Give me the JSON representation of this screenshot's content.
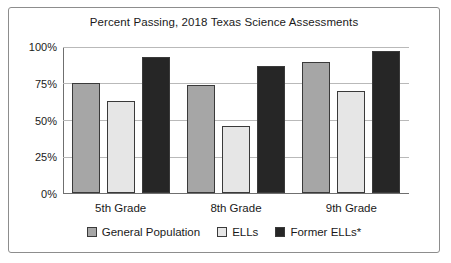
{
  "chart_data": {
    "type": "bar",
    "title": "Percent Passing, 2018 Texas Science Assessments",
    "xlabel": "",
    "ylabel": "",
    "categories": [
      "5th Grade",
      "8th Grade",
      "9th Grade"
    ],
    "series": [
      {
        "name": "General Population",
        "color": "#a6a6a6",
        "values": [
          75,
          74,
          90
        ]
      },
      {
        "name": "ELLs",
        "color": "#e6e6e6",
        "values": [
          63,
          46,
          70
        ]
      },
      {
        "name": "Former ELLs*",
        "color": "#262626",
        "values": [
          93,
          87,
          97
        ]
      }
    ],
    "ylim": [
      0,
      100
    ],
    "yticks": [
      "0%",
      "25%",
      "50%",
      "75%",
      "100%"
    ],
    "ytick_values": [
      0,
      25,
      50,
      75,
      100
    ],
    "grid": true,
    "legend_position": "bottom"
  }
}
